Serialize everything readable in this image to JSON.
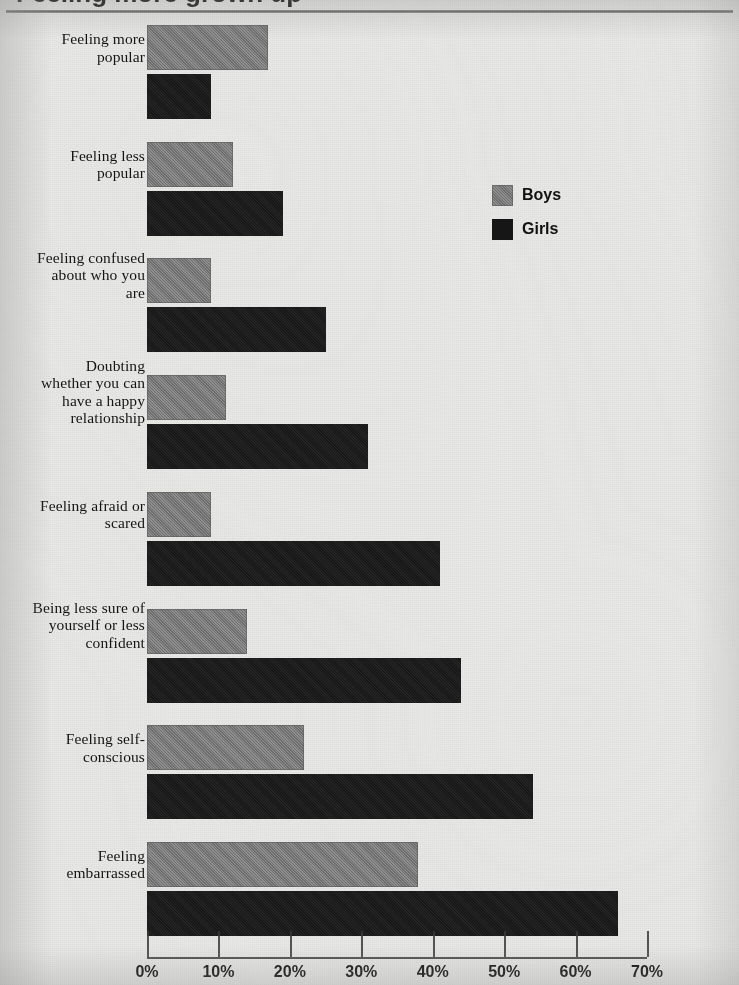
{
  "figure": {
    "title": "Feeling more grown up",
    "rule_visible": true
  },
  "legend": {
    "position": "center-right",
    "entries": [
      {
        "label": "Boys",
        "color": "#7c7c7c",
        "swatch": "boys-swatch"
      },
      {
        "label": "Girls",
        "color": "#1a1a1a",
        "swatch": "girls-swatch"
      }
    ]
  },
  "axis": {
    "orientation": "horizontal",
    "ticks": [
      "0%",
      "10%",
      "20%",
      "30%",
      "40%",
      "50%",
      "60%",
      "70%"
    ],
    "min": 0,
    "max": 70,
    "step": 10
  },
  "chart_data": {
    "type": "bar",
    "orientation": "horizontal",
    "title": "Feeling more grown up",
    "xlabel": "",
    "ylabel": "",
    "xlim": [
      0,
      70
    ],
    "xtick_labels": [
      "0%",
      "10%",
      "20%",
      "30%",
      "40%",
      "50%",
      "60%",
      "70%"
    ],
    "xtick_values": [
      0,
      10,
      20,
      30,
      40,
      50,
      60,
      70
    ],
    "grid": false,
    "legend_position": "center-right",
    "units": "percent",
    "categories": [
      "Feeling more popular",
      "Feeling less popular",
      "Feeling confused about who you are",
      "Doubting whether you can have a happy relationship",
      "Feeling afraid or scared",
      "Being less sure of yourself or less confident",
      "Feeling self-conscious",
      "Feeling embarrassed"
    ],
    "series": [
      {
        "name": "Boys",
        "color": "#7c7c7c",
        "values": [
          17,
          12,
          9,
          11,
          9,
          14,
          22,
          38
        ]
      },
      {
        "name": "Girls",
        "color": "#1a1a1a",
        "values": [
          9,
          19,
          25,
          31,
          41,
          44,
          54,
          66
        ]
      }
    ]
  },
  "labels": {
    "rows": [
      {
        "text": "Feeling more\npopular",
        "lines": [
          "Feeling more",
          "popular"
        ]
      },
      {
        "text": "Feeling less\npopular",
        "lines": [
          "Feeling less",
          "popular"
        ]
      },
      {
        "text": "Feeling confused\nabout who you\nare",
        "lines": [
          "Feeling confused",
          "about who you",
          "are"
        ]
      },
      {
        "text": "Doubting\nwhether you can\nhave a happy\nrelationship",
        "lines": [
          "Doubting",
          "whether you can",
          "have a happy",
          "relationship"
        ]
      },
      {
        "text": "Feeling afraid or\nscared",
        "lines": [
          "Feeling afraid or",
          "scared"
        ]
      },
      {
        "text": "Being less sure of\nyourself or less\nconfident",
        "lines": [
          "Being less sure of",
          "yourself or less",
          "confident"
        ]
      },
      {
        "text": "Feeling self-\nconscious",
        "lines": [
          "Feeling self-",
          "conscious"
        ]
      },
      {
        "text": "Feeling\nembarrassed",
        "lines": [
          "Feeling",
          "embarrassed"
        ]
      }
    ]
  }
}
